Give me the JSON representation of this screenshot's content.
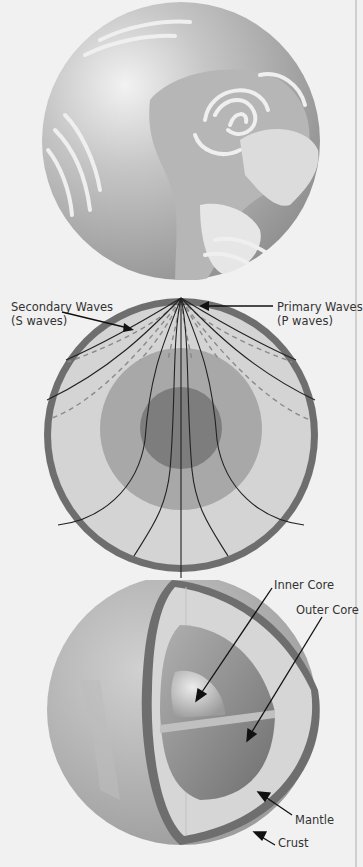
{
  "figure": {
    "panels": [
      {
        "id": "globe",
        "description": "Earth globe showing continents and cloud swirls"
      },
      {
        "id": "seismic-waves",
        "description": "Cross-section of Earth showing paths of seismic waves"
      },
      {
        "id": "layers-cutaway",
        "description": "Cutaway of Earth showing internal layers"
      }
    ],
    "seismic_labels": {
      "secondary_line1": "Secondary Waves",
      "secondary_line2": "(S waves)",
      "primary_line1": "Primary Waves",
      "primary_line2": "(P waves)"
    },
    "layer_labels": {
      "inner_core": "Inner Core",
      "outer_core": "Outer Core",
      "mantle": "Mantle",
      "crust": "Crust"
    },
    "colors": {
      "background": "#f1f1f1",
      "crust": "#6e6e6e",
      "mantle": "#d4d4d4",
      "outer_core": "#a8a8a8",
      "inner_core": "#7d7d7d",
      "wave_line": "#222222",
      "s_wave_dash": "#8a8a8a"
    }
  }
}
